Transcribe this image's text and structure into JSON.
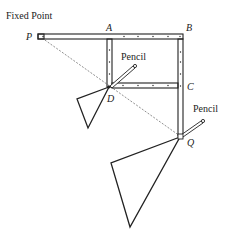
{
  "diagram": {
    "title": "Fixed Point",
    "labels": {
      "P": "P",
      "A": "A",
      "B": "B",
      "C": "C",
      "D": "D",
      "Q": "Q"
    },
    "pencil_labels": [
      "Pencil",
      "Pencil"
    ],
    "colors": {
      "ink": "#222222",
      "background": "#ffffff"
    }
  }
}
